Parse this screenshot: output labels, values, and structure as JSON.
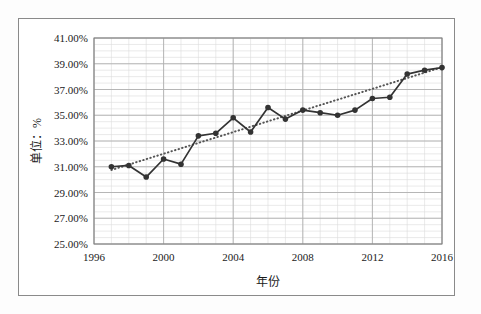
{
  "chart_data": {
    "type": "line",
    "title": "",
    "xlabel": "年份",
    "ylabel": "单位：%",
    "xlim": [
      1996,
      2016
    ],
    "ylim": [
      25,
      41
    ],
    "grid": true,
    "legend": "none",
    "x_ticks": [
      "1996",
      "2000",
      "2004",
      "2008",
      "2012",
      "2016"
    ],
    "x_tick_values": [
      1996,
      2000,
      2004,
      2008,
      2012,
      2016
    ],
    "y_ticks": [
      "25.00%",
      "27.00%",
      "29.00%",
      "31.00%",
      "33.00%",
      "35.00%",
      "37.00%",
      "39.00%",
      "41.00%"
    ],
    "y_tick_values": [
      25,
      27,
      29,
      31,
      33,
      35,
      37,
      39,
      41
    ],
    "x": [
      1997,
      1998,
      1999,
      2000,
      2001,
      2002,
      2003,
      2004,
      2005,
      2006,
      2007,
      2008,
      2009,
      2010,
      2011,
      2012,
      2013,
      2014,
      2015,
      2016
    ],
    "series": [
      {
        "name": "数据系列",
        "style": "solid-marker",
        "color": "#333333",
        "marker": "circle",
        "values": [
          31.0,
          31.1,
          30.2,
          31.6,
          31.2,
          33.4,
          33.6,
          34.8,
          33.7,
          35.6,
          34.7,
          35.4,
          35.2,
          35.0,
          35.4,
          36.3,
          36.4,
          38.2,
          38.5,
          38.7
        ]
      },
      {
        "name": "线性趋势线",
        "style": "dotted",
        "color": "#555555",
        "marker": "none",
        "values": [
          30.75,
          31.17,
          31.59,
          32.01,
          32.43,
          32.85,
          33.27,
          33.69,
          34.11,
          34.53,
          34.95,
          35.37,
          35.79,
          36.21,
          36.63,
          37.05,
          37.47,
          37.89,
          38.31,
          38.73
        ]
      }
    ]
  },
  "colors": {
    "frame": "#8a8a8a",
    "axis": "#7f7f7f",
    "major_grid": "#b0b0b0",
    "minor_grid": "#dcdcdc",
    "series": "#333333",
    "trend": "#555555",
    "text": "#1a1a1a",
    "background": "#ffffff"
  }
}
